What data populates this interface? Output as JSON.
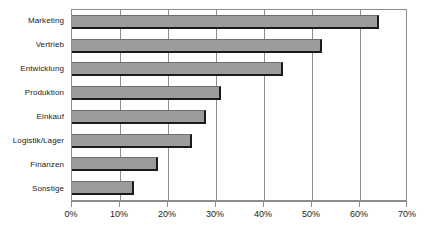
{
  "chart_data": {
    "type": "bar",
    "orientation": "horizontal",
    "title": "",
    "subtitle": "",
    "xlabel": "",
    "ylabel": "",
    "categories": [
      "Marketing",
      "Vertrieb",
      "Entwicklung",
      "Produktion",
      "Einkauf",
      "Logistik/Lager",
      "Finanzen",
      "Sonstige"
    ],
    "values": [
      64,
      52,
      44,
      31,
      28,
      25,
      18,
      13
    ],
    "value_unit": "%",
    "xlim": [
      0,
      70
    ],
    "xticks": [
      0,
      10,
      20,
      30,
      40,
      50,
      60,
      70
    ],
    "xtick_labels": [
      "0%",
      "10%",
      "20%",
      "30%",
      "40%",
      "50%",
      "60%",
      "70%"
    ],
    "grid": "vertical",
    "legend": "none",
    "series": [
      {
        "name": "Anteil",
        "values": [
          64,
          52,
          44,
          31,
          28,
          25,
          18,
          13
        ]
      }
    ],
    "colors": {
      "bar_fill": "#9c9c9c",
      "bar_shadow": "#1a1a1a",
      "gridline": "#8d8d8d",
      "axis": "#8d8d8d",
      "text": "#1b1b1b",
      "background": "#ffffff"
    }
  }
}
